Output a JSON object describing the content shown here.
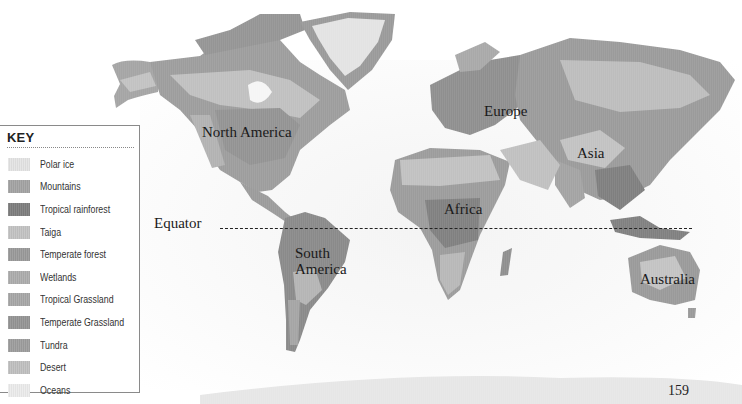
{
  "legend": {
    "title": "KEY",
    "items": [
      {
        "label": "Polar ice",
        "color": "#e4e4e4"
      },
      {
        "label": "Mountains",
        "color": "#a3a3a3"
      },
      {
        "label": "Tropical rainforest",
        "color": "#7e7e7e"
      },
      {
        "label": "Taiga",
        "color": "#c3c3c3"
      },
      {
        "label": "Temperate forest",
        "color": "#9a9a9a"
      },
      {
        "label": "Wetlands",
        "color": "#adadad"
      },
      {
        "label": "Tropical Grassland",
        "color": "#a7a7a7"
      },
      {
        "label": "Temperate Grassland",
        "color": "#959595"
      },
      {
        "label": "Tundra",
        "color": "#9d9d9d"
      },
      {
        "label": "Desert",
        "color": "#c0c0c0"
      },
      {
        "label": "Oceans",
        "color": "#ececec"
      }
    ]
  },
  "map": {
    "continent_labels": [
      {
        "name": "North America",
        "x": 202,
        "y": 124
      },
      {
        "name": "Europe",
        "x": 484,
        "y": 103
      },
      {
        "name": "Asia",
        "x": 577,
        "y": 145
      },
      {
        "name": "Africa",
        "x": 444,
        "y": 201
      },
      {
        "name": "South\nAmerica",
        "x": 295,
        "y": 245
      },
      {
        "name": "Australia",
        "x": 640,
        "y": 271
      }
    ],
    "equator_label": "Equator",
    "page_number": "159"
  }
}
